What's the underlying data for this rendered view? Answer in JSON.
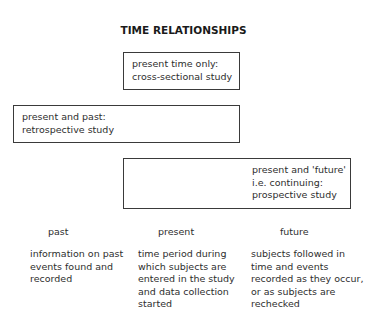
{
  "title": "TIME RELATIONSHIPS",
  "boxes": [
    {
      "line1": "present time only:",
      "line2": "cross-sectional study"
    },
    {
      "line1": "present and past:",
      "line2": "retrospective study"
    },
    {
      "line1": "present and 'future'",
      "line2": "i.e. continuing:",
      "line3": "prospective study"
    }
  ],
  "columns": [
    {
      "heading": "past",
      "description": "information on past\nevents found and\nrecorded"
    },
    {
      "heading": "present",
      "description": "time period during\nwhich subjects are\nentered in the study\nand data collection\nstarted"
    },
    {
      "heading": "future",
      "description": "subjects followed in\ntime and events\nrecorded as they occur,\nor as subjects are\nrechecked"
    }
  ]
}
